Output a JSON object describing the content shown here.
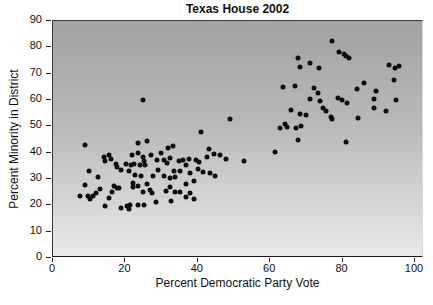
{
  "chart_data": {
    "type": "scatter",
    "title": "Texas House 2002",
    "xlabel": "Percent Democratic Party Vote",
    "ylabel": "Percent Minority in District",
    "xlim": [
      0,
      100
    ],
    "ylim": [
      0,
      90
    ],
    "x_ticks": [
      0,
      20,
      40,
      60,
      80,
      100
    ],
    "y_ticks": [
      0,
      10,
      20,
      30,
      40,
      50,
      60,
      70,
      80,
      90
    ],
    "grid": false,
    "legend": "none",
    "marker": {
      "shape": "circle",
      "color": "#0d0d0d",
      "size_px": 5
    },
    "plot_background": {
      "style": "vertical-gradient",
      "top_color": "#a2a2a2",
      "bottom_color": "#e9e9e9"
    },
    "points": [
      [
        8.9,
        42.9
      ],
      [
        14.0,
        38.4
      ],
      [
        15.6,
        39.3
      ],
      [
        14.5,
        37.0
      ],
      [
        16.0,
        37.7
      ],
      [
        17.4,
        35.8
      ],
      [
        17.6,
        34.5
      ],
      [
        18.8,
        33.6
      ],
      [
        20.2,
        35.8
      ],
      [
        21.1,
        33.2
      ],
      [
        21.5,
        35.2
      ],
      [
        10.0,
        33.2
      ],
      [
        12.4,
        30.7
      ],
      [
        8.9,
        27.7
      ],
      [
        7.5,
        23.6
      ],
      [
        9.6,
        23.4
      ],
      [
        10.2,
        22.3
      ],
      [
        11.1,
        23.4
      ],
      [
        11.9,
        24.5
      ],
      [
        13.1,
        26.1
      ],
      [
        16.3,
        24.9
      ],
      [
        17.8,
        26.6
      ],
      [
        16.9,
        27.5
      ],
      [
        18.3,
        26.4
      ],
      [
        15.6,
        22.6
      ],
      [
        14.4,
        19.8
      ],
      [
        18.8,
        19.1
      ],
      [
        20.4,
        19.8
      ],
      [
        21.1,
        18.7
      ],
      [
        21.3,
        20.3
      ],
      [
        23.6,
        20.1
      ],
      [
        25.2,
        20.0
      ],
      [
        22.3,
        35.8
      ],
      [
        21.7,
        39.0
      ],
      [
        23.4,
        40.0
      ],
      [
        23.4,
        43.7
      ],
      [
        26.0,
        44.4
      ],
      [
        24.8,
        38.4
      ],
      [
        25.2,
        36.9
      ],
      [
        24.0,
        35.3
      ],
      [
        25.4,
        35.2
      ],
      [
        27.1,
        39.3
      ],
      [
        28.7,
        37.2
      ],
      [
        29.8,
        40.0
      ],
      [
        31.7,
        41.6
      ],
      [
        33.1,
        42.6
      ],
      [
        30.7,
        37.1
      ],
      [
        31.4,
        35.9
      ],
      [
        32.4,
        38.0
      ],
      [
        34.9,
        36.7
      ],
      [
        29.1,
        33.6
      ],
      [
        33.5,
        33.2
      ],
      [
        35.2,
        33.2
      ],
      [
        22.7,
        31.6
      ],
      [
        24.3,
        31.1
      ],
      [
        27.5,
        31.1
      ],
      [
        30.6,
        31.3
      ],
      [
        32.4,
        30.3
      ],
      [
        33.7,
        30.7
      ],
      [
        22.0,
        28.5
      ],
      [
        23.6,
        27.5
      ],
      [
        26.0,
        28.1
      ],
      [
        26.8,
        25.8
      ],
      [
        24.8,
        25.2
      ],
      [
        27.3,
        24.6
      ],
      [
        31.2,
        25.5
      ],
      [
        33.7,
        25.1
      ],
      [
        32.3,
        26.8
      ],
      [
        35.1,
        24.9
      ],
      [
        36.7,
        23.2
      ],
      [
        32.6,
        21.7
      ],
      [
        28.5,
        21.1
      ],
      [
        22.2,
        26.8
      ],
      [
        24.9,
        59.9
      ],
      [
        36.0,
        37.2
      ],
      [
        36.8,
        35.5
      ],
      [
        37.7,
        37.6
      ],
      [
        39.5,
        37.2
      ],
      [
        40.4,
        36.6
      ],
      [
        42.5,
        38.5
      ],
      [
        43.0,
        41.3
      ],
      [
        44.5,
        39.6
      ],
      [
        46.0,
        39.0
      ],
      [
        47.7,
        37.5
      ],
      [
        40.0,
        33.8
      ],
      [
        41.4,
        32.7
      ],
      [
        37.8,
        32.1
      ],
      [
        43.4,
        32.1
      ],
      [
        44.8,
        31.2
      ],
      [
        39.0,
        29.1
      ],
      [
        36.7,
        28.2
      ],
      [
        37.8,
        24.8
      ],
      [
        39.0,
        22.5
      ],
      [
        40.9,
        47.7
      ],
      [
        48.8,
        52.8
      ],
      [
        52.8,
        36.8
      ],
      [
        61.4,
        40.3
      ],
      [
        67.8,
        45.0
      ],
      [
        62.6,
        49.3
      ],
      [
        64.2,
        50.8
      ],
      [
        64.6,
        49.6
      ],
      [
        67.1,
        49.3
      ],
      [
        68.5,
        50.3
      ],
      [
        65.8,
        56.3
      ],
      [
        68.1,
        54.7
      ],
      [
        69.9,
        54.4
      ],
      [
        63.4,
        65.1
      ],
      [
        66.9,
        65.4
      ],
      [
        67.8,
        75.8
      ],
      [
        68.3,
        72.5
      ],
      [
        70.9,
        74.0
      ],
      [
        70.9,
        60.3
      ],
      [
        72.0,
        64.5
      ],
      [
        73.2,
        62.5
      ],
      [
        73.6,
        72.0
      ],
      [
        73.8,
        59.5
      ],
      [
        74.7,
        57.0
      ],
      [
        75.5,
        56.0
      ],
      [
        76.8,
        53.4
      ],
      [
        77.2,
        52.9
      ],
      [
        77.1,
        82.3
      ],
      [
        79.0,
        78.4
      ],
      [
        80.3,
        77.5
      ],
      [
        81.0,
        76.8
      ],
      [
        81.9,
        75.9
      ],
      [
        78.7,
        60.6
      ],
      [
        79.8,
        59.9
      ],
      [
        81.2,
        59.0
      ],
      [
        80.9,
        44.2
      ],
      [
        83.9,
        64.2
      ],
      [
        84.2,
        53.1
      ],
      [
        86.0,
        66.5
      ],
      [
        88.8,
        60.3
      ],
      [
        88.6,
        57.0
      ],
      [
        89.3,
        63.4
      ],
      [
        92.0,
        56.0
      ],
      [
        92.9,
        73.2
      ],
      [
        94.6,
        72.3
      ],
      [
        94.3,
        67.7
      ],
      [
        95.7,
        73.0
      ],
      [
        94.8,
        60.1
      ]
    ]
  }
}
